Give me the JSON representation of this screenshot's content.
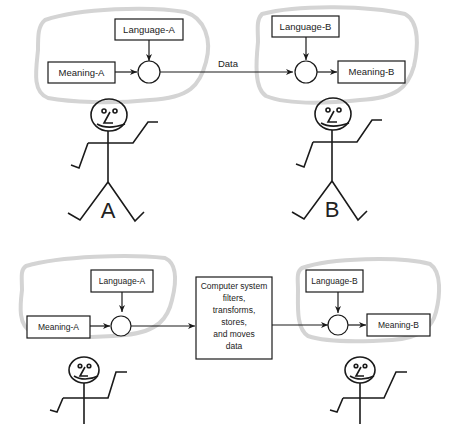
{
  "top_panel": {
    "sender": {
      "language_label": "Language-A",
      "meaning_label": "Meaning-A",
      "person_label": "A"
    },
    "channel_label": "Data",
    "receiver": {
      "language_label": "Language-B",
      "meaning_label": "Meaning-B",
      "person_label": "B"
    }
  },
  "bottom_panel": {
    "sender": {
      "language_label": "Language-A",
      "meaning_label": "Meaning-A"
    },
    "computer_box": {
      "lines": [
        "Computer system",
        "filters,",
        "transforms,",
        "stores,",
        "and moves",
        "data"
      ]
    },
    "receiver": {
      "language_label": "Language-B",
      "meaning_label": "Meaning-B"
    }
  },
  "colors": {
    "ink": "#1a1a1a",
    "cloud": "#d4d4d4",
    "background": "#ffffff"
  }
}
